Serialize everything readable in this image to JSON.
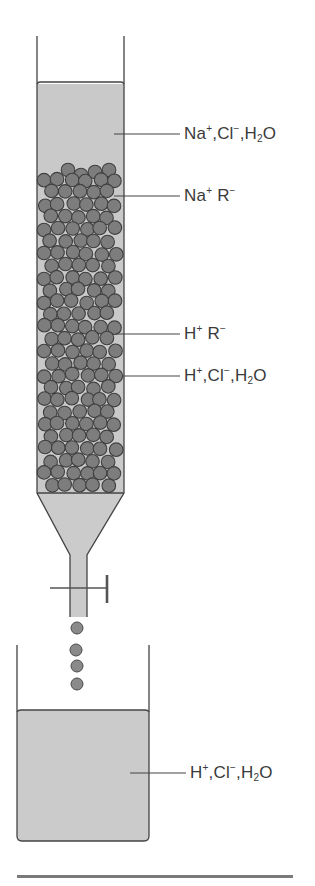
{
  "diagram": {
    "colors": {
      "liquid": "#c9c9c9",
      "bead_fill": "#7d7d7d",
      "bead_stroke": "#3f3f3f",
      "outline": "#444444",
      "text": "#3a3a3a",
      "base_line": "#7a7a7a"
    },
    "labels": [
      {
        "id": "top-solution",
        "parts": [
          [
            "Na",
            "+"
          ],
          [
            ",Cl",
            "−"
          ],
          [
            ",H",
            "",
            ""
          ],
          [
            "2"
          ],
          [
            "O"
          ]
        ],
        "text": "Na+, Cl−, H2O"
      },
      {
        "id": "resin-top",
        "text": "Na+ R−"
      },
      {
        "id": "resin-lower",
        "text": "H+ R−"
      },
      {
        "id": "column-eluate",
        "text": "H+, Cl−, H2O"
      },
      {
        "id": "beaker-solution",
        "text": "H+, Cl−, H2O"
      }
    ],
    "label_pieces": {
      "na": "Na",
      "h": "H",
      "cl": "Cl",
      "r": "R",
      "o": "O",
      "two": "2",
      "plus": "+",
      "minus": "−",
      "comma": ","
    },
    "components": {
      "column": "Glass column with resin beads",
      "stopcock": "Stopcock valve",
      "drops": 4,
      "beaker": "Collection beaker"
    }
  }
}
